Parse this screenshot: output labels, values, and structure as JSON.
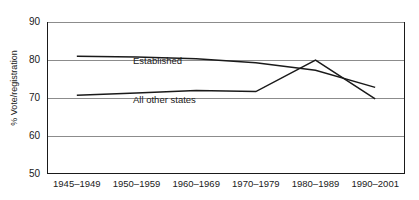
{
  "chart_data": {
    "type": "line",
    "title": "",
    "xlabel": "",
    "ylabel": "% Vote/registration",
    "categories": [
      "1945–1949",
      "1950–1959",
      "1960–1969",
      "1970–1979",
      "1980–1989",
      "1990–2001"
    ],
    "ylim": [
      50,
      90
    ],
    "yticks": [
      50,
      60,
      70,
      80,
      90
    ],
    "ytick_labels": [
      "50",
      "60",
      "70",
      "80",
      "90"
    ],
    "grid": true,
    "legend": "inline-labels",
    "series": [
      {
        "name": "Established",
        "values": [
          81.0,
          80.8,
          80.3,
          79.3,
          77.3,
          72.8
        ]
      },
      {
        "name": "All other states",
        "values": [
          70.7,
          71.3,
          72.0,
          71.7,
          80.0,
          69.8
        ]
      }
    ]
  },
  "colors": {
    "line": "#1a1a1a",
    "grid": "#8c8c8c",
    "axis": "#1a1a1a",
    "background": "#ffffff",
    "text": "#1a1a1a"
  }
}
